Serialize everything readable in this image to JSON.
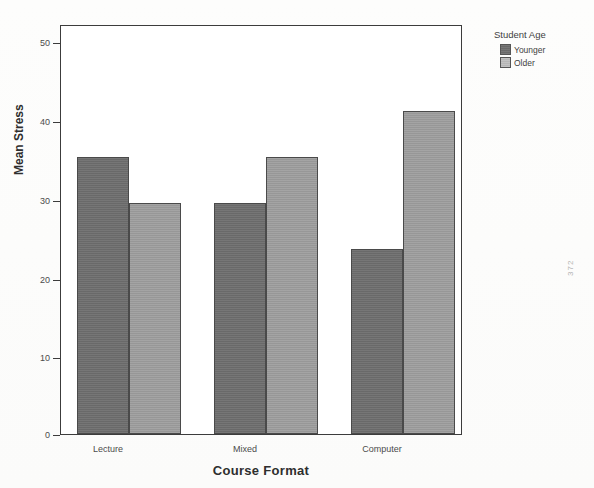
{
  "chart_data": {
    "type": "bar",
    "title": "",
    "subtitle": "",
    "xlabel": "Course Format",
    "ylabel": "Mean Stress",
    "categories": [
      "Lecture",
      "Mixed",
      "Computer"
    ],
    "series": [
      {
        "name": "Younger",
        "values": [
          36,
          30,
          24
        ],
        "color": "#6f6f6f"
      },
      {
        "name": "Older",
        "values": [
          30,
          36,
          42
        ],
        "color": "#9d9d9d"
      }
    ],
    "ylim": [
      0,
      53
    ],
    "yticks": [
      0,
      10,
      20,
      30,
      40,
      50
    ],
    "ytick_labels": [
      "0",
      "10",
      "20",
      "30",
      "40",
      "50"
    ],
    "grid": false,
    "legend": {
      "title": "Student Age",
      "position": "top-right",
      "entries": [
        "Younger",
        "Older"
      ]
    }
  },
  "legend": {
    "title": "Student Age",
    "items": [
      {
        "label": "Younger",
        "swatch": "younger-swatch"
      },
      {
        "label": "Older",
        "swatch": "older-swatch"
      }
    ]
  },
  "axes": {
    "y_title": "Mean Stress",
    "x_title": "Course Format",
    "y_ticks": [
      "50",
      "40",
      "30",
      "20",
      "10",
      "0"
    ],
    "x_ticks": [
      "Lecture",
      "Mixed",
      "Computer"
    ]
  },
  "artifact": {
    "margin_mark": "372"
  }
}
